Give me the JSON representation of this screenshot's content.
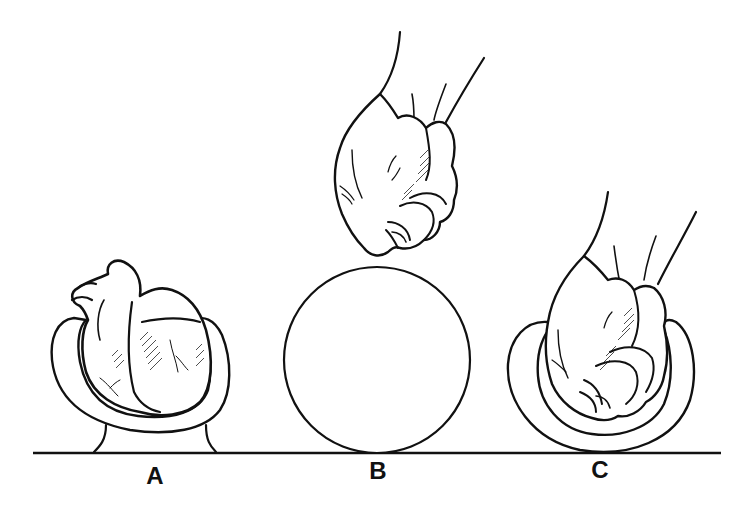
{
  "figure": {
    "colors": {
      "ink": "#111111",
      "background": "#ffffff"
    },
    "ground_line": {
      "x1": 33,
      "x2": 721,
      "y": 453
    },
    "panels": [
      {
        "id": "A",
        "label": "A",
        "subject": "heart resting in cup on pedestal",
        "icon": "heart-icon"
      },
      {
        "id": "B",
        "label": "B",
        "subject": "sphere with hand (fist) above",
        "icon": "sphere-icon"
      },
      {
        "id": "C",
        "label": "C",
        "subject": "fist resting in cup",
        "icon": "fist-icon"
      }
    ]
  }
}
